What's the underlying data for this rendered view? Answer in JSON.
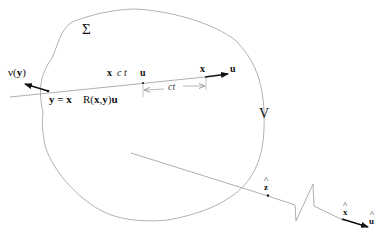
{
  "diagram": {
    "labels": {
      "surface": "Σ",
      "normal": "ν(",
      "normal_arg": "y",
      "normal_close": ")",
      "y_eq": "y = x",
      "reflection_R": "R(",
      "reflection_args": "x",
      "reflection_comma": ",",
      "reflection_y": "y",
      "reflection_close": ")",
      "reflection_u": "u",
      "x_minus": "x",
      "c_t": "c t",
      "u_mid": "u",
      "x_end": "x",
      "u_dir": "u",
      "ct_span": "ct",
      "volume": "V",
      "z_hat": "z",
      "x_hat": "x",
      "u_hat": "u",
      "hat_glyph": "^"
    },
    "colors": {
      "curve": "#a8a8a8",
      "line": "#9a9a9a",
      "arrow": "#111111",
      "text": "#111111"
    }
  }
}
